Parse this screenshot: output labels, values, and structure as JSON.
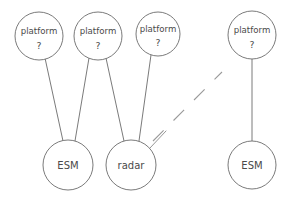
{
  "diagram": {
    "type": "node-link-graph",
    "canvas": {
      "width": 290,
      "height": 197
    },
    "stroke_color": "#6b6b6b",
    "text_color": "#4a4a4a",
    "background_color": "#ffffff",
    "nodes": [
      {
        "id": "platform1",
        "line1": "platform",
        "line2": "?",
        "cx": 39,
        "cy": 36,
        "r": 24,
        "kind": "platform"
      },
      {
        "id": "platform2",
        "line1": "platform",
        "line2": "?",
        "cx": 98,
        "cy": 36,
        "r": 24,
        "kind": "platform"
      },
      {
        "id": "platform3",
        "line1": "platform",
        "line2": "?",
        "cx": 158,
        "cy": 34,
        "r": 22,
        "kind": "platform"
      },
      {
        "id": "platform4",
        "line1": "platform",
        "line2": "?",
        "cx": 252,
        "cy": 35,
        "r": 24,
        "kind": "platform"
      },
      {
        "id": "esm1",
        "label": "ESM",
        "cx": 68,
        "cy": 165,
        "r": 25,
        "kind": "sensor"
      },
      {
        "id": "radar1",
        "label": "radar",
        "cx": 131,
        "cy": 165,
        "r": 25,
        "kind": "sensor"
      },
      {
        "id": "esm2",
        "label": "ESM",
        "cx": 252,
        "cy": 165,
        "r": 24,
        "kind": "sensor"
      }
    ],
    "edges": [
      {
        "from": "platform1",
        "to": "esm1",
        "x1": 45,
        "y1": 58,
        "x2": 63,
        "y2": 141
      },
      {
        "from": "platform2",
        "to": "esm1",
        "x1": 89,
        "y1": 58,
        "x2": 75,
        "y2": 141
      },
      {
        "from": "platform2",
        "to": "radar1",
        "x1": 106,
        "y1": 58,
        "x2": 124,
        "y2": 141
      },
      {
        "from": "platform3",
        "to": "radar1",
        "x1": 151,
        "y1": 55,
        "x2": 139,
        "y2": 141
      },
      {
        "from": "platform4",
        "to": "esm2",
        "x1": 252,
        "y1": 59,
        "x2": 252,
        "y2": 141
      }
    ],
    "edge_stubs": [
      {
        "from": "radar1",
        "x1": 150,
        "y1": 148,
        "x2": 166,
        "y2": 131
      }
    ],
    "break_indicator": {
      "style": "dashed-diagonal",
      "meaning": "continuation / omitted nodes",
      "x1": 153,
      "y1": 141,
      "x2": 222,
      "y2": 72
    }
  }
}
